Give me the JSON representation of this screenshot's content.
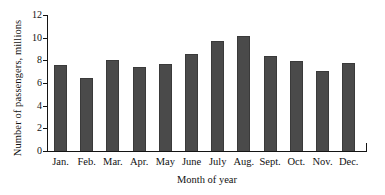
{
  "chart_data": {
    "type": "bar",
    "title": "",
    "xlabel": "Month of year",
    "ylabel": "Number of passengers, millions",
    "categories": [
      "Jan.",
      "Feb.",
      "Mar.",
      "Apr.",
      "May",
      "June",
      "July",
      "Aug.",
      "Sept.",
      "Oct.",
      "Nov.",
      "Dec."
    ],
    "values": [
      7.55,
      6.4,
      8.05,
      7.45,
      7.65,
      8.6,
      9.7,
      10.15,
      8.35,
      7.9,
      7.05,
      7.75
    ],
    "ylim": [
      0,
      12
    ],
    "ytick_labels": [
      "0",
      "2",
      "4",
      "6",
      "8",
      "10",
      "12"
    ],
    "ytick_values": [
      0,
      2,
      4,
      6,
      8,
      10,
      12
    ],
    "grid": false,
    "legend": null,
    "bar_color": "#4a4a4a",
    "axis_color": "#141414"
  }
}
